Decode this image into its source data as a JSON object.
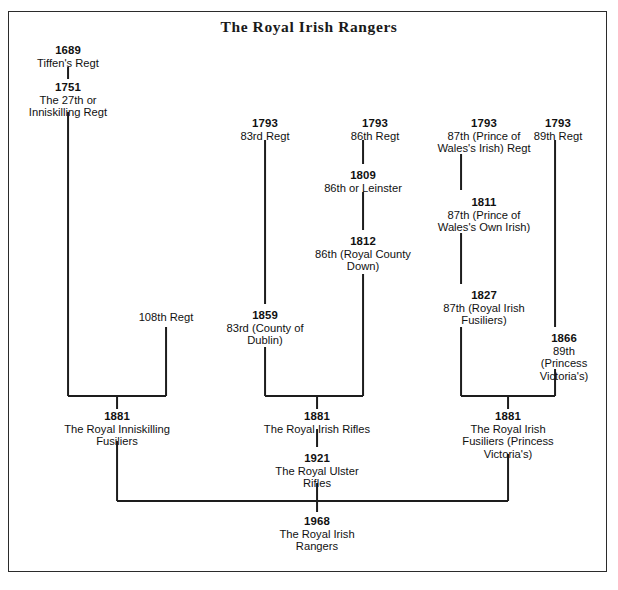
{
  "title": "The Royal Irish Rangers",
  "diagram": {
    "type": "lineage-tree",
    "nodes": [
      {
        "id": "n1689",
        "year": "1689",
        "name": "Tiffen's Regt",
        "x": 68,
        "y": 44
      },
      {
        "id": "n1751",
        "year": "1751",
        "name": "The 27th or\nInniskilling Regt",
        "x": 68,
        "y": 81
      },
      {
        "id": "n108",
        "year": "",
        "name": "108th Regt",
        "x": 166,
        "y": 311
      },
      {
        "id": "n1881a",
        "year": "1881",
        "name": "The Royal Inniskilling\nFusiliers",
        "x": 117,
        "y": 410
      },
      {
        "id": "n1793a",
        "year": "1793",
        "name": "83rd Regt",
        "x": 265,
        "y": 117
      },
      {
        "id": "n1859",
        "year": "1859",
        "name": "83rd (County of\nDublin)",
        "x": 265,
        "y": 309
      },
      {
        "id": "n1793b",
        "year": "1793",
        "name": "86th Regt",
        "x": 375,
        "y": 117
      },
      {
        "id": "n1809",
        "year": "1809",
        "name": "86th or Leinster",
        "x": 363,
        "y": 169
      },
      {
        "id": "n1812",
        "year": "1812",
        "name": "86th (Royal County\nDown)",
        "x": 363,
        "y": 235
      },
      {
        "id": "n1881b",
        "year": "1881",
        "name": "The Royal Irish Rifles",
        "x": 317,
        "y": 410
      },
      {
        "id": "n1921",
        "year": "1921",
        "name": "The Royal Ulster\nRifles",
        "x": 317,
        "y": 452
      },
      {
        "id": "n1793c",
        "year": "1793",
        "name": "87th (Prince of\nWales's Irish) Regt",
        "x": 484,
        "y": 117
      },
      {
        "id": "n1811",
        "year": "1811",
        "name": "87th (Prince of\nWales's Own Irish)",
        "x": 484,
        "y": 196
      },
      {
        "id": "n1827",
        "year": "1827",
        "name": "87th (Royal Irish\nFusiliers)",
        "x": 484,
        "y": 289
      },
      {
        "id": "n1793d",
        "year": "1793",
        "name": "89th Regt",
        "x": 558,
        "y": 117
      },
      {
        "id": "n1866",
        "year": "1866",
        "name": "89th (Princess\nVictoria's)",
        "x": 564,
        "y": 332
      },
      {
        "id": "n1881c",
        "year": "1881",
        "name": "The Royal Irish\nFusiliers (Princess\nVictoria's)",
        "x": 508,
        "y": 410
      },
      {
        "id": "n1968",
        "year": "1968",
        "name": "The Royal Irish\nRangers",
        "x": 317,
        "y": 515
      }
    ],
    "v_connectors": [
      {
        "name": "conn-1689-1751",
        "x": 68,
        "y": 67,
        "h": 12
      },
      {
        "name": "conn-1751-merge",
        "x": 68,
        "y": 112,
        "h": 284
      },
      {
        "name": "conn-108th-merge",
        "x": 166,
        "y": 327,
        "h": 69
      },
      {
        "name": "conn-merge1-1881a",
        "x": 117,
        "y": 395,
        "h": 14
      },
      {
        "name": "conn-1881a-final",
        "x": 117,
        "y": 441,
        "h": 60
      },
      {
        "name": "conn-83rd-1859",
        "x": 265,
        "y": 140,
        "h": 164
      },
      {
        "name": "conn-1859-merge",
        "x": 265,
        "y": 347,
        "h": 49
      },
      {
        "name": "conn-86th-1809",
        "x": 363,
        "y": 140,
        "h": 24
      },
      {
        "name": "conn-1809-1812",
        "x": 363,
        "y": 192,
        "h": 38
      },
      {
        "name": "conn-1812-merge",
        "x": 363,
        "y": 274,
        "h": 122
      },
      {
        "name": "conn-merge2-1881b",
        "x": 317,
        "y": 395,
        "h": 14
      },
      {
        "name": "conn-1881b-1921",
        "x": 317,
        "y": 429,
        "h": 18
      },
      {
        "name": "conn-1921-final",
        "x": 317,
        "y": 483,
        "h": 18
      },
      {
        "name": "conn-final-1968",
        "x": 317,
        "y": 500,
        "h": 12
      },
      {
        "name": "conn-87th-1811",
        "x": 461,
        "y": 154,
        "h": 36
      },
      {
        "name": "conn-1811-1827",
        "x": 461,
        "y": 233,
        "h": 51
      },
      {
        "name": "conn-1827-merge",
        "x": 461,
        "y": 327,
        "h": 69
      },
      {
        "name": "conn-89th-1866",
        "x": 555,
        "y": 140,
        "h": 187
      },
      {
        "name": "conn-1866-merge",
        "x": 555,
        "y": 369,
        "h": 27
      },
      {
        "name": "conn-merge3-1881c",
        "x": 508,
        "y": 395,
        "h": 14
      },
      {
        "name": "conn-1881c-final",
        "x": 508,
        "y": 454,
        "h": 47
      }
    ],
    "h_connectors": [
      {
        "name": "merge-bar-inniskilling",
        "x": 68,
        "y": 395,
        "w": 98
      },
      {
        "name": "merge-bar-irish-rifles",
        "x": 265,
        "y": 395,
        "w": 98
      },
      {
        "name": "merge-bar-irish-fus",
        "x": 461,
        "y": 395,
        "w": 94
      },
      {
        "name": "merge-bar-rangers",
        "x": 117,
        "y": 500,
        "w": 391
      }
    ],
    "colors": {
      "line": "#1d1d1d",
      "text": "#111111",
      "border": "#2b2b2b",
      "background": "#ffffff"
    }
  }
}
